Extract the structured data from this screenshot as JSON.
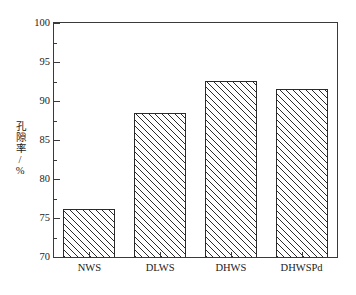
{
  "chart_data": {
    "type": "bar",
    "title": "",
    "xlabel": "",
    "ylabel": "孔隙率/%",
    "categories": [
      "NWS",
      "DLWS",
      "DHWS",
      "DHWSPd"
    ],
    "values": [
      76.1,
      88.4,
      92.6,
      91.6
    ],
    "ylim": [
      70,
      100
    ],
    "ytick_labels": [
      "70",
      "75",
      "80",
      "85",
      "90",
      "95",
      "100"
    ],
    "ytick_values": [
      70,
      75,
      80,
      85,
      90,
      95,
      100
    ],
    "yminor_values": [
      72.5,
      77.5,
      82.5,
      87.5,
      92.5,
      97.5
    ],
    "grid": false,
    "legend": false,
    "bar_fill": "#ffffff",
    "bar_edge": "#2b2b2b",
    "bar_hatch": "diagonal-lines",
    "axis_color": "#3a3a3a"
  }
}
